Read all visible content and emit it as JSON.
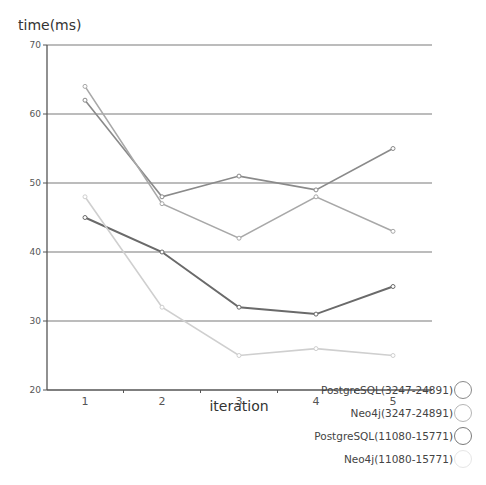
{
  "chart_data": {
    "type": "line",
    "title": "",
    "xlabel": "iteration",
    "ylabel": "time(ms)",
    "x": [
      1,
      2,
      3,
      4,
      5
    ],
    "xticks": [
      "1",
      "2",
      "3",
      "4",
      "5"
    ],
    "ylim": [
      20,
      70
    ],
    "yticks": [
      20,
      30,
      40,
      50,
      60,
      70
    ],
    "grid": true,
    "legend_position": "bottom-right",
    "series": [
      {
        "name": "PostgreSQL(3247-24891)",
        "values": [
          62,
          48,
          51,
          49,
          55
        ],
        "color": "#8a8a8a"
      },
      {
        "name": "Neo4j(3247-24891)",
        "values": [
          64,
          47,
          42,
          48,
          43
        ],
        "color": "#a8a8a8"
      },
      {
        "name": "PostgreSQL(11080-15771)",
        "values": [
          45,
          40,
          32,
          31,
          35
        ],
        "color": "#6a6a6a"
      },
      {
        "name": "Neo4j(11080-15771)",
        "values": [
          48,
          32,
          25,
          26,
          25
        ],
        "color": "#cfcfcf"
      }
    ]
  },
  "legend": {
    "items": [
      {
        "label": "PostgreSQL(3247-24891)",
        "swatch_color": "#8a8a8a"
      },
      {
        "label": "Neo4j(3247-24891)",
        "swatch_color": "#b5b5b5"
      },
      {
        "label": "PostgreSQL(11080-15771)",
        "swatch_color": "#7a7a7a"
      },
      {
        "label": "Neo4j(11080-15771)",
        "swatch_color": "#e6e6e6"
      }
    ]
  }
}
